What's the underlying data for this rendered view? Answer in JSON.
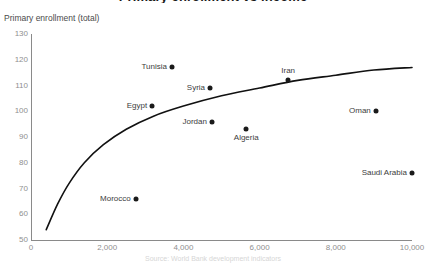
{
  "chart_data": {
    "type": "scatter",
    "title": "Primary enrollment vs income",
    "caption": "Source: World Bank development indicators",
    "ylabel": "Primary enrollment (total)",
    "xlabel": "",
    "xlim": [
      0,
      10000
    ],
    "ylim": [
      50,
      130
    ],
    "yticks": [
      130,
      120,
      110,
      100,
      90,
      80,
      70,
      60,
      50
    ],
    "xticks": [
      0,
      2000,
      4000,
      6000,
      8000,
      10000
    ],
    "xtick_labels": [
      "0",
      "2,000",
      "4,000",
      "6,000",
      "8,000",
      "10,000"
    ],
    "grid": false,
    "legend": "none",
    "points": [
      {
        "name": "Morocco",
        "x": 2750,
        "y": 66,
        "label_pos": "left"
      },
      {
        "name": "Egypt",
        "x": 3180,
        "y": 102,
        "label_pos": "left"
      },
      {
        "name": "Tunisia",
        "x": 3700,
        "y": 117,
        "label_pos": "left"
      },
      {
        "name": "Syria",
        "x": 4700,
        "y": 109,
        "label_pos": "left"
      },
      {
        "name": "Jordan",
        "x": 4750,
        "y": 96,
        "label_pos": "left"
      },
      {
        "name": "Algeria",
        "x": 5650,
        "y": 93,
        "label_pos": "below"
      },
      {
        "name": "Iran",
        "x": 6750,
        "y": 112,
        "label_pos": "above"
      },
      {
        "name": "Oman",
        "x": 9050,
        "y": 100,
        "label_pos": "left"
      },
      {
        "name": "Saudi Arabia",
        "x": 10000,
        "y": 76,
        "label_pos": "left"
      }
    ],
    "trend_curve": {
      "name": "log-fit-trend",
      "color": "#111111",
      "points": [
        {
          "x": 400,
          "y": 54
        },
        {
          "x": 700,
          "y": 64
        },
        {
          "x": 1000,
          "y": 72
        },
        {
          "x": 1400,
          "y": 80
        },
        {
          "x": 1900,
          "y": 87
        },
        {
          "x": 2500,
          "y": 93
        },
        {
          "x": 3200,
          "y": 98
        },
        {
          "x": 4000,
          "y": 102
        },
        {
          "x": 5000,
          "y": 106
        },
        {
          "x": 6000,
          "y": 109
        },
        {
          "x": 7000,
          "y": 112
        },
        {
          "x": 8000,
          "y": 114
        },
        {
          "x": 9000,
          "y": 116
        },
        {
          "x": 10000,
          "y": 117
        }
      ]
    }
  }
}
